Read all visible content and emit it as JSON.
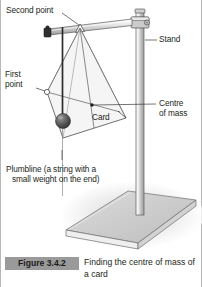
{
  "figure": {
    "number_label": "Figure 3.4.2",
    "caption": "Finding the centre of mass of a card",
    "tag_color": "#9a9a9a",
    "background_color": "#ffffff",
    "border_color": "#b8b8b8"
  },
  "annotations": {
    "second_point": "Second point",
    "first_point_line1": "First",
    "first_point_line2": "point",
    "stand": "Stand",
    "centre_of_mass_line1": "Centre",
    "centre_of_mass_line2": "of mass",
    "card": "Card",
    "plumbline_line1": "Plumbline (a string with a",
    "plumbline_line2": "small weight on the end)"
  },
  "apparatus": {
    "stand_rod_color": "#d9d9d9",
    "stand_rod_outline": "#5a5a5a",
    "base_top_color": "#c9c9c9",
    "base_side_color": "#e8e8e8",
    "card_fill": "#f2f2f2",
    "card_outline": "#4d4d4d",
    "plumb_bob_color": "#4a4a4a",
    "string_color": "#2b2b2b",
    "clamp_color": "#c0c0c0",
    "shadow_color": "#d5d5d5",
    "leader_line_color": "#3a3a3a"
  }
}
